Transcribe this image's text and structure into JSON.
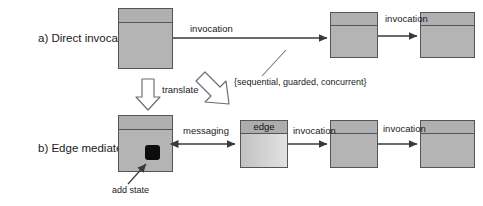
{
  "diagram": {
    "title_row_a": "a) Direct invocation",
    "title_row_b": "b) Edge mediated",
    "rows": [
      {
        "id": "a",
        "label": "a) Direct invocation",
        "components": [
          "component-1",
          "component-2",
          "component-3"
        ],
        "connector_labels": [
          "invocation",
          "invocation"
        ],
        "annotation": "{sequential, guarded, concurrent}"
      },
      {
        "id": "b",
        "label": "b) Edge mediated",
        "components": [
          "component-1",
          "edge",
          "component-2",
          "component-3"
        ],
        "connector_labels": [
          "messaging",
          "invocation",
          "invocation"
        ],
        "annotation": "add state"
      }
    ],
    "labels": {
      "invocation_a1": "invocation",
      "invocation_a2": "invocation",
      "translate": "translate",
      "sequential_set": "{sequential, guarded, concurrent}",
      "messaging": "messaging",
      "invocation_b1": "invocation",
      "invocation_b2": "invocation",
      "add_state": "add state",
      "edge_box_title": "edge"
    },
    "colors": {
      "component_fill": "#b4b4b4",
      "component_stroke": "#555555",
      "edge_fill": "#d2d2d2",
      "state_marker": "#0d0d0d",
      "line": "#3a3a3a",
      "text": "#1a1a1a"
    }
  }
}
